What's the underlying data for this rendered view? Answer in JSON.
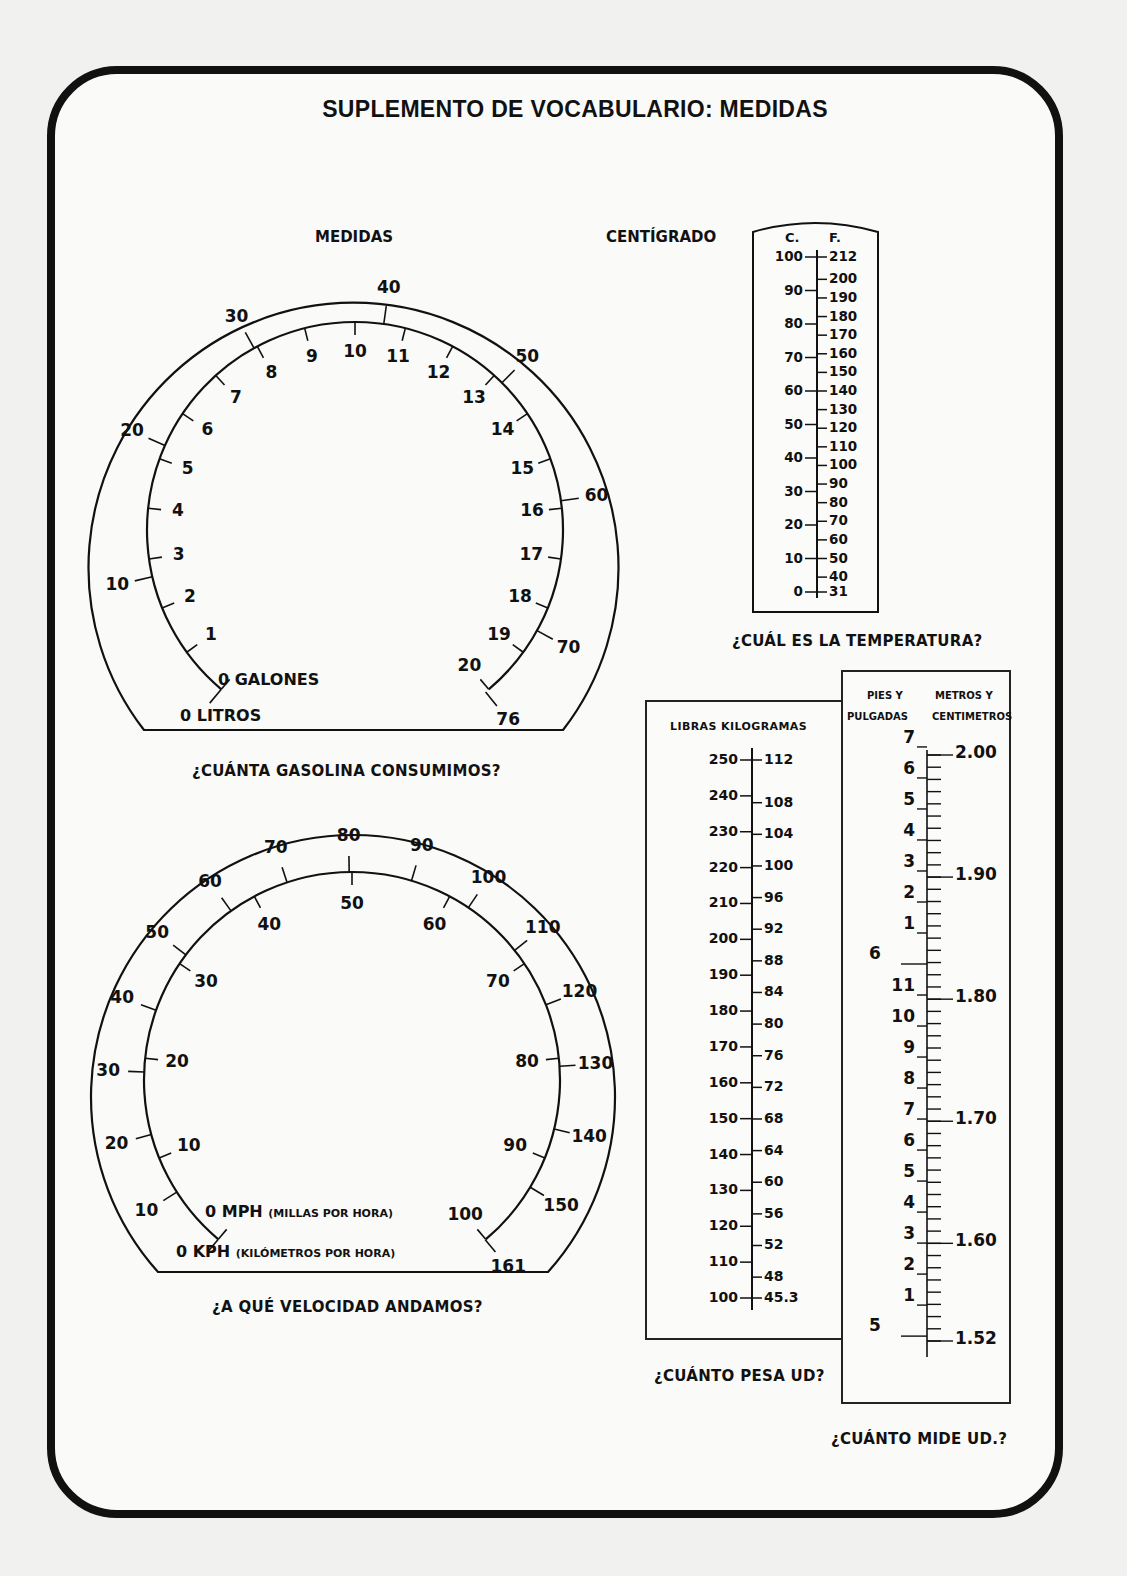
{
  "page": {
    "title": "SUPLEMENTO DE VOCABULARIO: MEDIDAS",
    "section_label_left": "MEDIDAS",
    "section_label_right": "CENTÍGRADO"
  },
  "gas_gauge": {
    "caption": "¿CUÁNTA GASOLINA CONSUMIMOS?",
    "inner_unit_label": "0  GALONES",
    "outer_unit_label": "0 LITROS",
    "inner_scale_gallons": [
      "0",
      "1",
      "2",
      "3",
      "4",
      "5",
      "6",
      "7",
      "8",
      "9",
      "10",
      "11",
      "12",
      "13",
      "14",
      "15",
      "16",
      "17",
      "18",
      "19",
      "20"
    ],
    "outer_scale_liters": [
      "0",
      "10",
      "20",
      "30",
      "40",
      "50",
      "60",
      "70",
      "76"
    ]
  },
  "speedometer": {
    "caption": "¿A QUÉ VELOCIDAD ANDAMOS?",
    "mph_label": "0  MPH",
    "mph_sub": "(MILLAS POR HORA)",
    "kph_label": "0 KPH",
    "kph_sub": "(KILÓMETROS POR HORA)",
    "inner_scale_mph": [
      "0",
      "10",
      "20",
      "30",
      "40",
      "50",
      "60",
      "70",
      "80",
      "90",
      "100"
    ],
    "outer_scale_kph": [
      "0",
      "10",
      "20",
      "30",
      "40",
      "50",
      "60",
      "70",
      "80",
      "90",
      "100",
      "110",
      "120",
      "130",
      "140",
      "150",
      "161"
    ]
  },
  "thermometer": {
    "caption": "¿CUÁL ES LA TEMPERATURA?",
    "col_c": "C.",
    "col_f": "F.",
    "celsius": [
      "100",
      "90",
      "80",
      "70",
      "60",
      "50",
      "40",
      "30",
      "20",
      "10",
      "0"
    ],
    "fahrenheit": [
      "212",
      "200",
      "190",
      "180",
      "170",
      "160",
      "150",
      "140",
      "130",
      "120",
      "110",
      "100",
      "90",
      "80",
      "70",
      "60",
      "50",
      "40",
      "31"
    ]
  },
  "weight_scale": {
    "caption": "¿CUÁNTO PESA UD?",
    "header": "LIBRAS  KILOGRAMAS",
    "pounds": [
      "250",
      "240",
      "230",
      "220",
      "210",
      "200",
      "190",
      "180",
      "170",
      "160",
      "150",
      "140",
      "130",
      "120",
      "110",
      "100"
    ],
    "kilograms": [
      "112",
      "108",
      "104",
      "100",
      "96",
      "92",
      "88",
      "84",
      "80",
      "76",
      "72",
      "68",
      "64",
      "60",
      "56",
      "52",
      "48",
      "45.3"
    ]
  },
  "height_scale": {
    "caption": "¿CUÁNTO MIDE UD.?",
    "header_left_1": "PIES Y",
    "header_left_2": "PULGADAS",
    "header_right_1": "METROS Y",
    "header_right_2": "CENTIMETROS",
    "feet_major": [
      "6",
      "5"
    ],
    "inches_upper": [
      "7",
      "6",
      "5",
      "4",
      "3",
      "2",
      "1"
    ],
    "inches_lower": [
      "11",
      "10",
      "9",
      "8",
      "7",
      "6",
      "5",
      "4",
      "3",
      "2",
      "1"
    ],
    "meters": [
      "2.00",
      "1.90",
      "1.80",
      "1.70",
      "1.60",
      "1.52"
    ]
  }
}
